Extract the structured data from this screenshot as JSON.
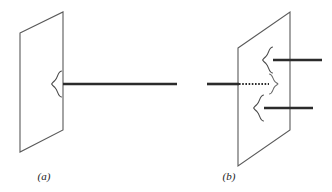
{
  "figure": {
    "background_color": "#ffffff",
    "ink_color": "#3a3a3a",
    "rod_color": "#2b2b2b",
    "caption_color": "#1c1c1c",
    "width": 332,
    "height": 192,
    "panels": [
      {
        "id": "panel-a",
        "caption": "(a)",
        "caption_x": 44,
        "caption_y": 180,
        "plane": {
          "name": "plane-parallelogram-a",
          "points": "20,33 63,12 63,130 20,152",
          "description": "parallelogram representing a plane seen in perspective"
        },
        "rod": {
          "name": "rod-a",
          "x1": 63,
          "x2": 177,
          "y": 84,
          "thickness": 2.6,
          "style": "solid"
        },
        "braces": [
          {
            "name": "brace-a-left",
            "orientation": "left",
            "x": 57,
            "y": 84,
            "height": 26,
            "width": 9
          }
        ]
      },
      {
        "id": "panel-b",
        "caption": "(b)",
        "caption_x": 229,
        "caption_y": 180,
        "plane": {
          "name": "plane-parallelogram-b",
          "points": "238,48 290,12 290,130 238,166",
          "description": "parallelogram representing a plane seen in perspective"
        },
        "rods": [
          {
            "name": "rod-b-upper",
            "x1": 273,
            "x2": 322,
            "y": 60,
            "thickness": 2.6,
            "style": "solid"
          },
          {
            "name": "rod-b-incoming-solid",
            "x1": 207,
            "x2": 238,
            "y": 84,
            "thickness": 2.6,
            "style": "solid"
          },
          {
            "name": "rod-b-incoming-dotted",
            "x1": 238,
            "x2": 268,
            "y": 84,
            "thickness": 2.2,
            "style": "dotted"
          },
          {
            "name": "rod-b-lower",
            "x1": 264,
            "x2": 313,
            "y": 108,
            "thickness": 2.6,
            "style": "solid"
          }
        ],
        "braces": [
          {
            "name": "brace-b-upper",
            "orientation": "left",
            "x": 268,
            "y": 60,
            "height": 26,
            "width": 9
          },
          {
            "name": "brace-b-middle",
            "orientation": "right",
            "x": 271,
            "y": 84,
            "height": 22,
            "width": 8
          },
          {
            "name": "brace-b-lower",
            "orientation": "left",
            "x": 259,
            "y": 108,
            "height": 26,
            "width": 9
          }
        ]
      }
    ]
  }
}
